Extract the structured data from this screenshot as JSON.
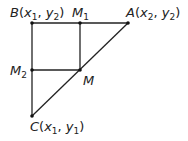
{
  "diagram": {
    "points": {
      "B": {
        "label": "B",
        "coords": [
          "x",
          "1",
          "y",
          "2"
        ],
        "x": 32,
        "y": 23
      },
      "M1": {
        "label": "M",
        "sub": "1",
        "x": 80,
        "y": 23
      },
      "A": {
        "label": "A",
        "coords": [
          "x",
          "2",
          "y",
          "2"
        ],
        "x": 128,
        "y": 23
      },
      "M2": {
        "label": "M",
        "sub": "2",
        "x": 32,
        "y": 70
      },
      "M": {
        "label": "M",
        "x": 80,
        "y": 70
      },
      "C": {
        "label": "C",
        "coords": [
          "x",
          "1",
          "y",
          "1"
        ],
        "x": 32,
        "y": 116
      }
    },
    "segments": [
      [
        "B",
        "A"
      ],
      [
        "B",
        "C"
      ],
      [
        "C",
        "A"
      ],
      [
        "M1",
        "M"
      ],
      [
        "M2",
        "M"
      ]
    ],
    "line_color": "#222222"
  }
}
